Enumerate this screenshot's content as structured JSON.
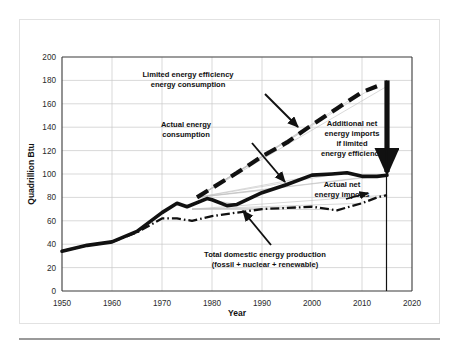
{
  "chart_data": {
    "type": "line",
    "title": "",
    "xlabel": "Year",
    "ylabel": "Quadrillion Btu",
    "xlim": [
      1950,
      2020
    ],
    "ylim": [
      0,
      200
    ],
    "xticks": [
      1950,
      1960,
      1970,
      1980,
      1990,
      2000,
      2010,
      2020
    ],
    "yticks": [
      0,
      20,
      40,
      60,
      80,
      100,
      120,
      140,
      160,
      180,
      200
    ],
    "grid": true,
    "legend": "none (direct annotations)",
    "series": [
      {
        "name": "Actual energy consumption",
        "style": "thick-solid-black",
        "x": [
          1950,
          1955,
          1960,
          1965,
          1970,
          1973,
          1975,
          1979,
          1980,
          1983,
          1985,
          1990,
          1995,
          2000,
          2004,
          2007,
          2010,
          2013,
          2015
        ],
        "values": [
          34,
          39,
          42,
          51,
          67,
          75,
          72,
          79,
          78,
          73,
          74,
          84,
          91,
          99,
          100,
          101,
          98,
          98,
          99
        ]
      },
      {
        "name": "Limited energy efficiency energy consumption",
        "style": "thick-dashed-black",
        "x": [
          1977,
          1980,
          1985,
          1990,
          1995,
          2000,
          2005,
          2010,
          2013
        ],
        "values": [
          80,
          88,
          101,
          115,
          127,
          142,
          156,
          170,
          175
        ]
      },
      {
        "name": "Total domestic energy production (fossil + nuclear + renewable)",
        "style": "dash-dot-black",
        "x": [
          1950,
          1955,
          1960,
          1965,
          1970,
          1973,
          1976,
          1980,
          1985,
          1990,
          1995,
          2000,
          2005,
          2010,
          2013,
          2015
        ],
        "values": [
          34,
          39,
          42,
          50,
          62,
          62,
          60,
          64,
          67,
          70,
          71,
          72,
          69,
          75,
          80,
          82
        ]
      }
    ],
    "annotations": [
      {
        "name": "limited-efficiency-label",
        "lines": [
          "Limited energy efficiency",
          "energy consumption"
        ],
        "points_to_series": "Limited energy efficiency energy consumption"
      },
      {
        "name": "actual-consumption-label",
        "lines": [
          "Actual energy",
          "consumption"
        ],
        "points_to_series": "Actual energy consumption"
      },
      {
        "name": "additional-imports-label",
        "lines": [
          "Additional net",
          "energy  imports",
          "if limited",
          "energy efficiency"
        ],
        "points_to_series": "gap between limited-efficiency and actual consumption at 2015"
      },
      {
        "name": "actual-net-imports-label",
        "lines": [
          "Actual net",
          "energy imports"
        ],
        "points_to_series": "gap between actual consumption and domestic production"
      },
      {
        "name": "domestic-production-label",
        "lines": [
          "Total domestic energy production",
          "(fossil + nuclear + renewable)"
        ],
        "points_to_series": "Total domestic energy production (fossil + nuclear + renewable)"
      }
    ],
    "gap_arrow": {
      "name": "additional-imports-gap-arrow",
      "x": 2015,
      "y_top": 180,
      "y_bottom": 100
    },
    "colors": {
      "series_line": "#111111",
      "grid": "#c9c9c9",
      "fan_lines": "#c0c0c0",
      "axis": "#3a3a3a",
      "background": "#ffffff",
      "card_border": "#e2e2e2",
      "footer_rule": "#9a9a9a"
    }
  }
}
